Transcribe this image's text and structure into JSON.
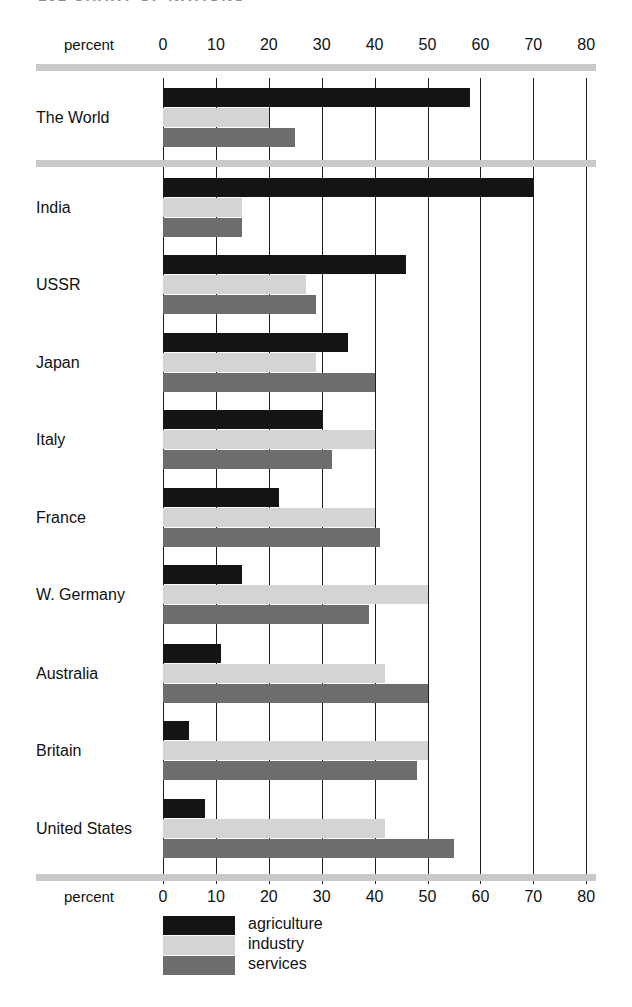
{
  "page_header": {
    "text": "102   CHART OF NATIONS"
  },
  "axis": {
    "name": "percent",
    "ticks": [
      0,
      10,
      20,
      30,
      40,
      50,
      60,
      70,
      80
    ],
    "tick_labels": [
      "0",
      "10",
      "20",
      "30",
      "40",
      "50",
      "60",
      "70",
      "80"
    ]
  },
  "legend": {
    "position": "bottom",
    "items": [
      {
        "key": "agriculture",
        "label": "agriculture",
        "color": "#141414"
      },
      {
        "key": "industry",
        "label": "industry",
        "color": "#d4d4d4"
      },
      {
        "key": "services",
        "label": "services",
        "color": "#6d6d6d"
      }
    ]
  },
  "chart_data": {
    "type": "bar",
    "orientation": "horizontal",
    "title": "",
    "subtitle": "",
    "xlabel": "percent",
    "ylabel": "",
    "xlim": [
      0,
      80
    ],
    "grid": true,
    "categories": [
      "The World",
      "India",
      "USSR",
      "Japan",
      "Italy",
      "France",
      "W. Germany",
      "Australia",
      "Britain",
      "United States"
    ],
    "series": [
      {
        "name": "agriculture",
        "color": "#141414",
        "values": [
          58,
          70,
          46,
          35,
          30,
          22,
          15,
          11,
          5,
          8
        ]
      },
      {
        "name": "industry",
        "color": "#d4d4d4",
        "values": [
          20,
          15,
          27,
          29,
          40,
          40,
          50,
          42,
          50,
          42
        ]
      },
      {
        "name": "services",
        "color": "#6d6d6d",
        "values": [
          25,
          15,
          29,
          40,
          32,
          41,
          39,
          50,
          48,
          55
        ]
      }
    ]
  }
}
